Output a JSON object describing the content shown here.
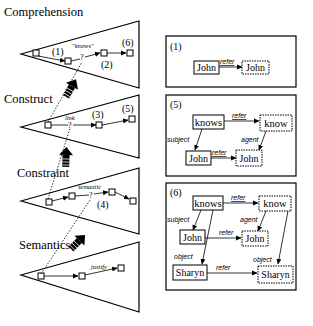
{
  "left_diagram": {
    "levels": [
      {
        "label": "Comprehension",
        "annotations": {
          "n1": "(1)",
          "word": "\"knows\"",
          "n2": "(2)",
          "n6": "(6)"
        }
      },
      {
        "label": "Construct",
        "annotations": {
          "word": "link",
          "n3": "(3)",
          "n5": "(5)"
        }
      },
      {
        "label": "Constraint",
        "annotations": {
          "word": "semantic",
          "n4": "(4)"
        }
      },
      {
        "label": "Semantics",
        "annotations": {
          "word": "justify"
        }
      }
    ]
  },
  "panels": [
    {
      "id": "(1)",
      "nodes": {
        "a": "John",
        "b": "John"
      },
      "edges": {
        "refer": "refer"
      }
    },
    {
      "id": "(5)",
      "nodes": {
        "knows": "knows",
        "know": "know",
        "john1": "John",
        "john2": "John"
      },
      "edges": {
        "refer1": "refer",
        "subject": "subject",
        "agent": "agent",
        "refer2": "refer"
      }
    },
    {
      "id": "(6)",
      "nodes": {
        "knows": "knows",
        "know": "know",
        "john1": "John",
        "john2": "John",
        "sharyn1": "Sharyn",
        "sharyn2": "Sharyn"
      },
      "edges": {
        "refer1": "refer",
        "subject": "subject",
        "agent": "agent",
        "refer2": "refer",
        "object1": "object",
        "object2": "object",
        "refer3": "refer"
      }
    }
  ]
}
